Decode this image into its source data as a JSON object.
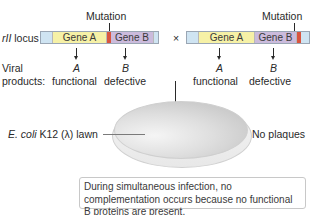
{
  "diagram": {
    "locus_label_italic": "rII",
    "locus_label_rest": " locus",
    "cross_symbol": "×",
    "left": {
      "mutation_label": "Mutation",
      "gene_a_label": "Gene A",
      "gene_b_label": "Gene B",
      "product_a_letter": "A",
      "product_b_letter": "B",
      "product_a_status": "functional",
      "product_b_status": "defective"
    },
    "right": {
      "mutation_label": "Mutation",
      "gene_a_label": "Gene A",
      "gene_b_label": "Gene B",
      "product_a_letter": "A",
      "product_b_letter": "B",
      "product_a_status": "functional",
      "product_b_status": "defective"
    },
    "viral_label": "Viral",
    "products_label": "products:",
    "lawn_label_italic": "E. coli",
    "lawn_label_rest": " K12 (λ) lawn",
    "result_label": "No plaques",
    "note": "During simultaneous infection, no complementation occurs because no functional B proteins are present.",
    "colors": {
      "gene_a": "#f6f1a6",
      "gene_b": "#cbbbdc",
      "flank": "#cfe4f2",
      "mutation": "#d9553f"
    }
  }
}
